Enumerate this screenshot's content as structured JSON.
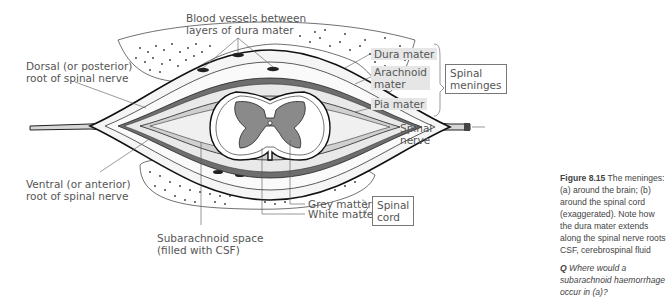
{
  "figure": {
    "labels": {
      "blood_vessels": [
        "Blood vessels  between",
        "layers of dura mater"
      ],
      "dorsal_root": [
        "Dorsal (or posterior)",
        "root of spinal nerve"
      ],
      "ventral_root": [
        "Ventral (or anterior)",
        "root of spinal nerve"
      ],
      "dura_mater": "Dura mater",
      "arachnoid_mater": [
        "Arachnoid",
        "mater"
      ],
      "pia_mater": "Pia mater",
      "spinal_nerve": [
        "Spinal",
        "nerve"
      ],
      "grey_matter": "Grey matter",
      "white_matter": "White matter",
      "subarachnoid": [
        "Subarachnoid space",
        "(filled with CSF)"
      ]
    },
    "groups": {
      "spinal_meninges": [
        "Spinal",
        "meninges"
      ],
      "spinal_cord": [
        "Spinal",
        "cord"
      ]
    },
    "colors": {
      "grey_matter": "#8a8a8a",
      "dura": "#6e6e6e",
      "label_bg": "#e6e6e6",
      "line": "#222222"
    }
  },
  "caption": {
    "figure_number": "Figure 8.15",
    "text": " The meninges: (a) around the brain; (b) around the spinal cord (exaggerated). Note how the dura mater extends along the spinal nerve roots CSF, cerebrospinal fluid",
    "question_marker": "Q",
    "question": " Where would a subarachnoid haemorrhage occur in (a)?"
  }
}
